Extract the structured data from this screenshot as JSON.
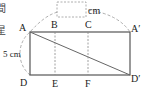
{
  "diagram": {
    "edge_fragments": [
      "間",
      "星"
    ],
    "answer_box_unit": "cm",
    "side_label": "5 cm",
    "points": {
      "A": "A",
      "B": "B",
      "C": "C",
      "A_prime": "A′",
      "D": "D",
      "E": "E",
      "F": "F",
      "D_prime": "D′"
    },
    "colors": {
      "line": "#555555",
      "dashed": "#888888",
      "text": "#222222"
    }
  }
}
